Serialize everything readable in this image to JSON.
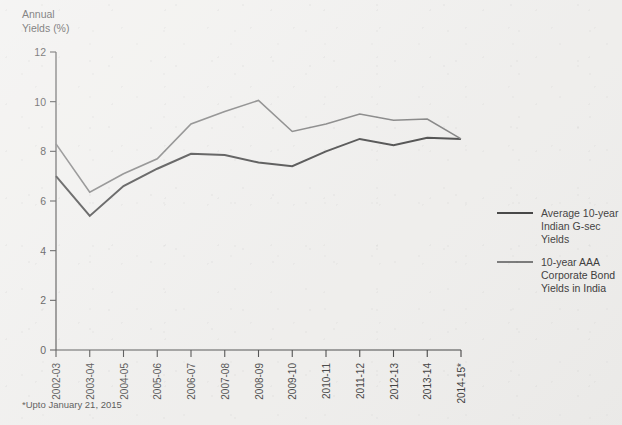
{
  "axis_title": "Annual\nYields (%)",
  "footnote": "*Upto January 21, 2015",
  "colors": {
    "gsec": "#2e2e2e",
    "corporate": "#6e6e6e",
    "axis": "#333333",
    "background": "#efeeec"
  },
  "legend": {
    "position": "right",
    "items": [
      {
        "label": "Average 10-year Indian G-sec Yields",
        "line1": "Average 10-year",
        "line2": "Indian G-sec",
        "line3": "Yields",
        "color": "#2e2e2e"
      },
      {
        "label": "10-year AAA Corporate Bond Yields in India",
        "line1": "10-year AAA",
        "line2": "Corporate Bond",
        "line3": "Yields in India",
        "color": "#6e6e6e"
      }
    ]
  },
  "chart_data": {
    "type": "line",
    "title": "",
    "subtitle": "",
    "xlabel": "",
    "ylabel": "Annual Yields (%)",
    "ylim": [
      0,
      12
    ],
    "yticks": [
      0,
      2,
      4,
      6,
      8,
      10,
      12
    ],
    "ytick_labels": [
      "0",
      "2",
      "4",
      "6",
      "8",
      "10",
      "12"
    ],
    "grid": false,
    "legend_position": "right",
    "annotations": [
      "*Upto January 21, 2015"
    ],
    "categories": [
      "2002-03",
      "2003-04",
      "2004-05",
      "2005-06",
      "2006-07",
      "2007-08",
      "2008-09",
      "2009-10",
      "2010-11",
      "2011-12",
      "2012-13",
      "2013-14",
      "2014-15*"
    ],
    "series": [
      {
        "name": "Average 10-year Indian G-sec Yields",
        "color": "#2e2e2e",
        "values": [
          7.0,
          5.4,
          6.6,
          7.3,
          7.9,
          7.85,
          7.55,
          7.4,
          8.0,
          8.5,
          8.25,
          8.55,
          8.5
        ]
      },
      {
        "name": "10-year AAA Corporate Bond Yields in India",
        "color": "#6e6e6e",
        "values": [
          8.3,
          6.35,
          7.1,
          7.7,
          9.1,
          9.6,
          10.05,
          8.8,
          9.1,
          9.5,
          9.25,
          9.3,
          8.5
        ]
      }
    ]
  }
}
